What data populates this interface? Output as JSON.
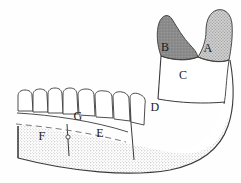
{
  "figure": {
    "type": "anatomical-line-drawing",
    "background_color": "#fefefe",
    "ink_color": "#2b2b2b",
    "labels": [
      {
        "id": "A",
        "text": "A",
        "x": 208,
        "y": 52,
        "region": "condylar-process"
      },
      {
        "id": "B",
        "text": "B",
        "x": 165,
        "y": 51,
        "region": "coronoid-process"
      },
      {
        "id": "C",
        "text": "C",
        "x": 183,
        "y": 79,
        "region": "ramus"
      },
      {
        "id": "D",
        "text": "D",
        "x": 155,
        "y": 111,
        "region": "angle-of-mandible"
      },
      {
        "id": "E",
        "text": "E",
        "x": 100,
        "y": 137,
        "region": "body-posterior"
      },
      {
        "id": "F",
        "text": "F",
        "x": 42,
        "y": 140,
        "region": "body-anterior"
      },
      {
        "id": "G",
        "text": "G",
        "x": 78,
        "y": 120,
        "region": "alveolar-process"
      }
    ],
    "teeth": {
      "count": 8,
      "name": "mandibular-teeth-row"
    },
    "markers": [
      {
        "name": "mental-foramen",
        "x": 68,
        "y": 137,
        "r": 2.1
      }
    ],
    "textures": {
      "coronoid_fill": "#8f8f8f",
      "condyle_fill": "#b9b9b9",
      "body_stipple": "#d9d9d9",
      "ramus_fill": "#ffffff"
    }
  }
}
